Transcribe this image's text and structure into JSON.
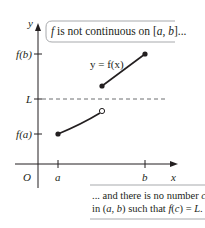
{
  "diagram": {
    "axes": {
      "x_label": "x",
      "y_label": "y",
      "origin_label": "O",
      "x_ticks": [
        "a",
        "b"
      ],
      "y_ticks": [
        "f(b)",
        "L",
        "f(a)"
      ]
    },
    "curve_label": "y = f(x)",
    "callout_top": {
      "text_parts": [
        "f",
        " is not continuous on [",
        "a",
        ", ",
        "b",
        "]..."
      ]
    },
    "callout_bottom": {
      "line1_parts": [
        "... and there is no number ",
        "c"
      ],
      "line2_parts": [
        "in (",
        "a",
        ", ",
        "b",
        ") such that ",
        "f",
        "(",
        "c",
        ") = ",
        "L",
        "."
      ]
    },
    "segments": [
      {
        "name": "lower",
        "start": "f(a) at a, filled dot",
        "end": "open circle below L"
      },
      {
        "name": "upper",
        "start": "filled dot above L",
        "end": "f(b) at b, filled dot"
      }
    ],
    "colors": {
      "ink": "#231f20",
      "dashed_line": "#6d6e71",
      "box_border": "#a7a9ac"
    }
  }
}
